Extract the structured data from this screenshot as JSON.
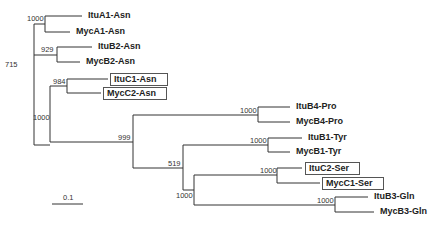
{
  "tree": {
    "leaves": [
      {
        "name": "ItuA1-Asn",
        "boxed": false
      },
      {
        "name": "MycA1-Asn",
        "boxed": false
      },
      {
        "name": "ItuB2-Asn",
        "boxed": false
      },
      {
        "name": "MycB2-Asn",
        "boxed": false
      },
      {
        "name": "ItuC1-Asn",
        "boxed": true
      },
      {
        "name": "MycC2-Asn",
        "boxed": true
      },
      {
        "name": "ItuB4-Pro",
        "boxed": false
      },
      {
        "name": "MycB4-Pro",
        "boxed": false
      },
      {
        "name": "ItuB1-Tyr",
        "boxed": false
      },
      {
        "name": "MycB1-Tyr",
        "boxed": false
      },
      {
        "name": "ItuC2-Ser",
        "boxed": true
      },
      {
        "name": "MycC1-Ser",
        "boxed": true
      },
      {
        "name": "ItuB3-Gln",
        "boxed": false
      },
      {
        "name": "MycB3-Gln",
        "boxed": false
      }
    ],
    "bootstrap": {
      "a1": "1000",
      "b2": "929",
      "asn_root": "715",
      "c_asn": "984",
      "lower": "1000",
      "pro": "1000",
      "tyr_group": "999",
      "tyr": "1000",
      "ser_gln_group": "519",
      "ser_gln": "1000",
      "ser": "1000",
      "gln": "1000"
    },
    "scale_bar": {
      "label": "0.1"
    }
  }
}
